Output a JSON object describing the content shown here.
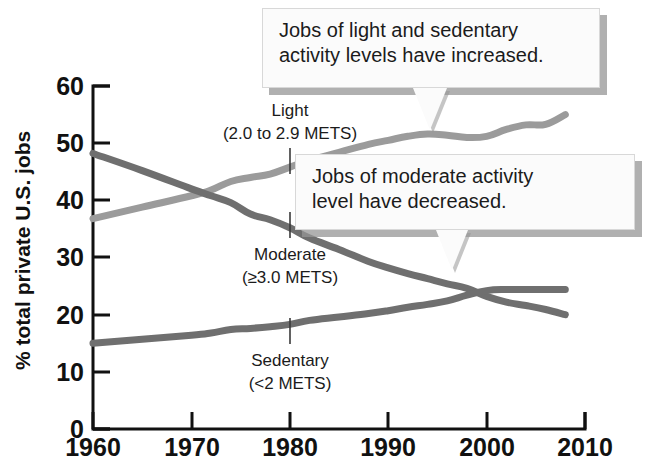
{
  "chart_data": {
    "type": "line",
    "title": "",
    "subtitle": "",
    "xlabel": "",
    "ylabel": "% total private U.S. jobs",
    "xlim": [
      1960,
      2010
    ],
    "ylim": [
      0,
      60
    ],
    "grid": false,
    "legend_position": "inline-labels",
    "x_ticks": [
      "1960",
      "1970",
      "1980",
      "1990",
      "2000",
      "2010"
    ],
    "y_ticks": [
      "0",
      "10",
      "20",
      "30",
      "40",
      "50",
      "60"
    ],
    "x": [
      1960,
      1965,
      1970,
      1972,
      1974,
      1976,
      1978,
      1980,
      1982,
      1985,
      1988,
      1990,
      1992,
      1994,
      1996,
      1998,
      2000,
      2002,
      2004,
      2006,
      2008
    ],
    "series": [
      {
        "name": "Light",
        "detail": "(2.0 to 2.9 METS)",
        "color": "#9b9b9b",
        "values": [
          36.8,
          38.8,
          40.8,
          41.8,
          43.3,
          44.0,
          44.6,
          45.8,
          47.0,
          48.4,
          49.8,
          50.5,
          51.2,
          51.6,
          51.4,
          51.0,
          51.2,
          52.4,
          53.2,
          53.3,
          55.0
        ]
      },
      {
        "name": "Moderate",
        "detail": "(≥3.0 METS)",
        "color": "#6f6f6f",
        "values": [
          48.2,
          45.2,
          42.0,
          40.8,
          39.6,
          37.6,
          36.6,
          35.2,
          33.4,
          31.4,
          29.3,
          28.2,
          27.2,
          26.3,
          25.4,
          24.6,
          23.2,
          22.2,
          21.6,
          20.9,
          20.0
        ]
      },
      {
        "name": "Sedentary",
        "detail": "(<2 METS)",
        "color": "#6f6f6f",
        "values": [
          15.0,
          15.7,
          16.4,
          16.8,
          17.4,
          17.6,
          17.9,
          18.3,
          19.0,
          19.6,
          20.2,
          20.7,
          21.3,
          21.8,
          22.4,
          23.4,
          24.2,
          24.4,
          24.4,
          24.4,
          24.4
        ]
      }
    ],
    "annotations": [
      {
        "id": "callout-one",
        "text": "Jobs of light and sedentary\nactivity levels have increased.",
        "points_to": "Light"
      },
      {
        "id": "callout-two",
        "text": "Jobs of moderate activity\nlevel have decreased.",
        "points_to": "Moderate"
      }
    ]
  },
  "axes": {
    "y_title": "% total private U.S. jobs",
    "y_ticks": [
      "60",
      "50",
      "40",
      "30",
      "20",
      "10",
      "0"
    ],
    "x_ticks": [
      "1960",
      "1970",
      "1980",
      "1990",
      "2000",
      "2010"
    ]
  },
  "series_labels": {
    "light_name": "Light",
    "light_detail": "(2.0 to 2.9 METS)",
    "moderate_name": "Moderate",
    "moderate_detail": "(≥3.0 METS)",
    "sedentary_name": "Sedentary",
    "sedentary_detail": "(<2 METS)"
  },
  "callouts": {
    "one_line_one": "Jobs of light and sedentary",
    "one_line_two": "activity levels have increased.",
    "two_line_one": "Jobs of moderate activity",
    "two_line_two": "level have decreased."
  },
  "colors": {
    "light_line": "#9b9b9b",
    "dark_line": "#6f6f6f",
    "axis": "#111111",
    "callout_bg": "#fbfbfb",
    "callout_shadow": "#969696"
  }
}
